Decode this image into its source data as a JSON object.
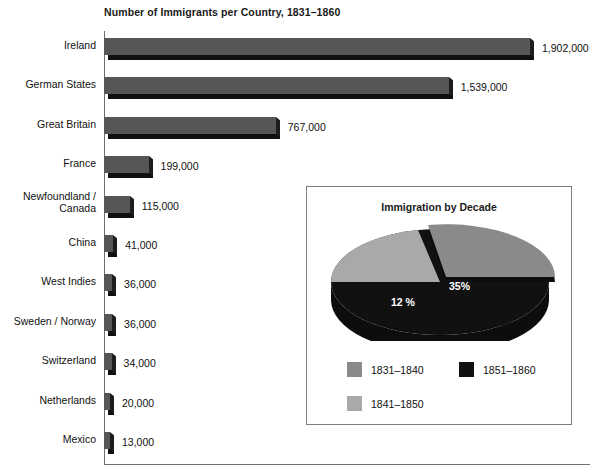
{
  "chart_data": [
    {
      "type": "bar",
      "title": "Number of Immigrants per Country, 1831–1860",
      "orientation": "horizontal",
      "xlabel": "",
      "ylabel": "",
      "xlim": [
        0,
        2000000
      ],
      "grid": false,
      "legend": "none",
      "categories": [
        "Ireland",
        "German States",
        "Great Britain",
        "France",
        "Newfoundland /\nCanada",
        "China",
        "West Indies",
        "Sweden / Norway",
        "Switzerland",
        "Netherlands",
        "Mexico"
      ],
      "values": [
        1902000,
        1539000,
        767000,
        199000,
        115000,
        41000,
        36000,
        36000,
        34000,
        20000,
        13000
      ],
      "value_labels": [
        "1,902,000",
        "1,539,000",
        "767,000",
        "199,000",
        "115,000",
        "41,000",
        "36,000",
        "36,000",
        "34,000",
        "20,000",
        "13,000"
      ],
      "bar_color": "#565656",
      "bar_shadow_color": "#101010"
    },
    {
      "type": "pie",
      "title": "Immigration by Decade",
      "labels": [
        "1831–1840",
        "1841–1850",
        "1851–1860"
      ],
      "values": [
        12,
        35,
        53
      ],
      "slice_labels": [
        "12 %",
        "35%",
        "53%"
      ],
      "colors": [
        "#8c8c8c",
        "#a8a8a8",
        "#111111"
      ],
      "legend": "bottom",
      "exploded_slice": "1841–1850"
    }
  ],
  "inset": {
    "legend": [
      {
        "label": "1831–1840",
        "color": "#8a8a8a"
      },
      {
        "label": "1851–1860",
        "color": "#111111"
      },
      {
        "label": "1841–1850",
        "color": "#a9a9a9"
      }
    ]
  }
}
